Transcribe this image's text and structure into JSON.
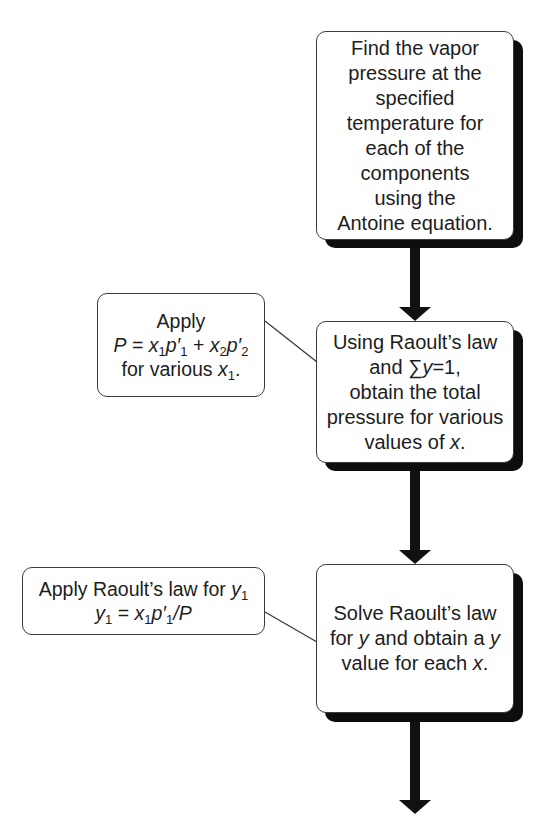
{
  "diagram": {
    "type": "flowchart",
    "direction": "top-to-bottom",
    "colors": {
      "box_border": "#3a3a3a",
      "shadow": "#0d0d0d",
      "arrow": "#111111",
      "background": "#ffffff"
    },
    "steps": [
      {
        "id": "step1",
        "lines": [
          "Find the vapor",
          "pressure at the",
          "specified",
          "temperature for",
          "each of the",
          "components",
          "using the",
          "Antoine equation."
        ]
      },
      {
        "id": "step2",
        "lines": [
          "Using Raoult’s law",
          "and ∑y=1,",
          "obtain the total",
          "pressure for various",
          "values of x."
        ],
        "line2": {
          "prefix": "and ∑",
          "var": "y",
          "suffix": "=1,"
        },
        "line5": {
          "prefix": "values of ",
          "var": "x",
          "suffix": "."
        }
      },
      {
        "id": "step3",
        "lines": [
          "Solve Raoult’s law",
          "for y and obtain a y",
          "value for each x."
        ],
        "line2": {
          "a": "for ",
          "v1": "y",
          "b": " and obtain a ",
          "v2": "y"
        },
        "line3": {
          "a": "value for each ",
          "v": "x",
          "b": "."
        }
      }
    ],
    "callouts": [
      {
        "id": "callout1",
        "attached_to": "step2",
        "title": "Apply",
        "equation_text": "P = x1p′1 + x2p′2",
        "eq": {
          "P": "P",
          "eq": " = ",
          "x": "x",
          "s1": "1",
          "p": "p′",
          "plus": " + ",
          "s2": "2"
        },
        "footer": {
          "prefix": "for various ",
          "var": "x",
          "sub": "1",
          "suffix": "."
        }
      },
      {
        "id": "callout2",
        "attached_to": "step3",
        "title": {
          "prefix": "Apply Raoult’s law for ",
          "var": "y",
          "sub": "1"
        },
        "equation_text": "y1 = x1p′1/P",
        "eq": {
          "y": "y",
          "s1": "1",
          "eq": " = ",
          "x": "x",
          "p": "p′",
          "slash": "/",
          "P": "P"
        }
      }
    ],
    "arrows": [
      {
        "from": "step1",
        "to": "step2"
      },
      {
        "from": "step2",
        "to": "step3"
      },
      {
        "from": "step3",
        "to": "next"
      }
    ]
  }
}
